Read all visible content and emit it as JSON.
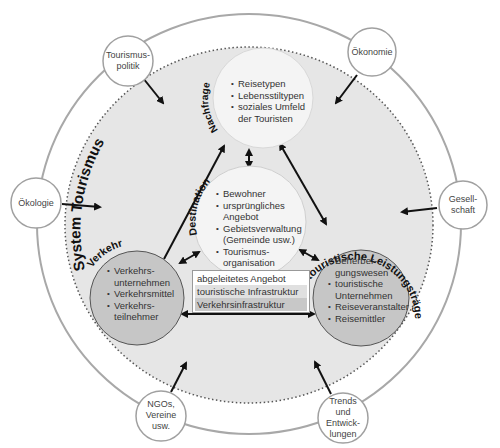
{
  "diagram": {
    "title": "System Tourismus",
    "colors": {
      "outer_ring": "#a0a0a0",
      "system_fill": "#e4e4e4",
      "light_circle": "#f4f4f4",
      "dark_circle": "#c6c6c6",
      "arrow": "#111111"
    },
    "external_factors": [
      {
        "id": "tourismuspolitik",
        "label": "Tourismus-\npolitik"
      },
      {
        "id": "oekonomie",
        "label": "Ökonomie"
      },
      {
        "id": "oekologie",
        "label": "Ökologie"
      },
      {
        "id": "gesellschaft",
        "label": "Gesell-\nschaft"
      },
      {
        "id": "ngos",
        "label": "NGOs,\nVereine\nusw."
      },
      {
        "id": "trends",
        "label": "Trends\nund\nEntwick-\nlungen"
      }
    ],
    "subsystems": {
      "nachfrage": {
        "title": "Nachfrage",
        "items": [
          "Reisetypen",
          "Lebensstiltypen",
          "soziales Umfeld der Touristen"
        ]
      },
      "destination": {
        "title": "Destination",
        "items": [
          "Bewohner",
          "ursprüngliches Angebot",
          "Gebietsverwaltung (Gemeinde usw.)",
          "Tourismus-organisation"
        ]
      },
      "verkehr": {
        "title": "Verkehr",
        "items": [
          "Verkehrs-unternehmen",
          "Verkehrsmittel",
          "Verkehrs-teilnehmer"
        ]
      },
      "leistungstraeger": {
        "title": "touristische Leistungsträger",
        "items": [
          "Beherber-gungswesen",
          "touristische Unternehmen",
          "Reiseveranstalter",
          "Reisemittler"
        ]
      }
    },
    "derived_offer_box": [
      "abgeleitetes Angebot",
      "touristische Infrastruktur",
      "Verkehrsinfrastruktur"
    ]
  }
}
